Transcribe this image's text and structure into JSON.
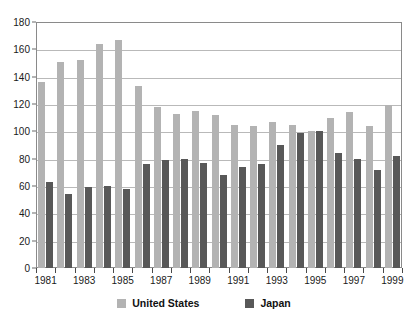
{
  "chart_data": {
    "type": "bar",
    "title": "",
    "subtitle": "",
    "xlabel": "",
    "ylabel": "",
    "ylim": [
      0,
      180
    ],
    "ytick_step": 20,
    "yticks": [
      0,
      20,
      40,
      60,
      80,
      100,
      120,
      140,
      160,
      180
    ],
    "grid": true,
    "legend_position": "bottom",
    "categories": [
      "1981",
      "1982",
      "1983",
      "1984",
      "1985",
      "1986",
      "1987",
      "1988",
      "1989",
      "1990",
      "1991",
      "1992",
      "1993",
      "1994",
      "1995",
      "1996",
      "1997",
      "1998",
      "1999"
    ],
    "xtick_labels_shown": [
      "1981",
      "1983",
      "1985",
      "1987",
      "1989",
      "1991",
      "1993",
      "1995",
      "1997",
      "1999"
    ],
    "series": [
      {
        "name": "United States",
        "color": "#b3b3b3",
        "values": [
          136,
          151,
          152,
          164,
          167,
          133,
          118,
          113,
          115,
          112,
          105,
          104,
          107,
          105,
          100,
          110,
          114,
          104,
          119
        ]
      },
      {
        "name": "Japan",
        "color": "#585858",
        "values": [
          63,
          54,
          59,
          60,
          58,
          76,
          79,
          80,
          77,
          68,
          74,
          76,
          90,
          99,
          100,
          84,
          80,
          72,
          82
        ]
      }
    ]
  },
  "legend": {
    "items": [
      {
        "label": "United States",
        "color": "#b3b3b3"
      },
      {
        "label": "Japan",
        "color": "#585858"
      }
    ]
  },
  "colors": {
    "united_states": "#b3b3b3",
    "japan": "#585858",
    "gridline": "#b9b9b9",
    "axis": "#8a8a8a",
    "background": "#ffffff",
    "text": "#1a1a1a"
  }
}
